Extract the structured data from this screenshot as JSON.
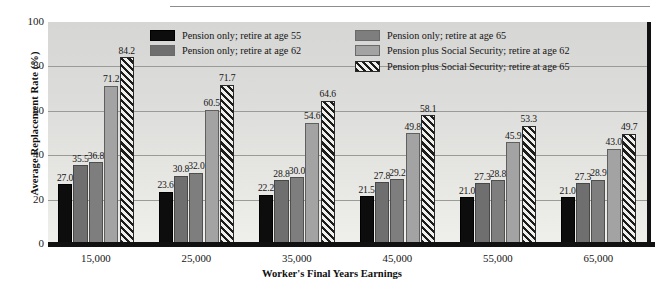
{
  "chart_data": {
    "type": "bar",
    "title": "",
    "subtitle": "",
    "xlabel": "Worker's Final Years Earnings",
    "ylabel": "Average Replacement Rate (%)",
    "categories": [
      "15,000",
      "25,000",
      "35,000",
      "45,000",
      "55,000",
      "65,000"
    ],
    "ylim": [
      0,
      100
    ],
    "yticks": [
      0,
      20,
      40,
      60,
      80,
      100
    ],
    "grid": true,
    "gridlines_at": [
      20,
      40,
      60,
      80
    ],
    "legend_position": "top-center",
    "series": [
      {
        "name": "Pension only; retire at age 55",
        "color": "#0d0d0d",
        "pattern": "solid",
        "values": [
          27.0,
          23.6,
          22.2,
          21.5,
          21.0,
          21.0
        ],
        "labels": [
          "27.0",
          "23.6",
          "22.2",
          "21.5",
          "21.0",
          "21.0"
        ]
      },
      {
        "name": "Pension only; retire at age 62",
        "color": "#6f6f6f",
        "pattern": "solid",
        "values": [
          35.5,
          30.8,
          28.8,
          27.8,
          27.3,
          27.3
        ],
        "labels": [
          "35.5",
          "30.8",
          "28.8",
          "27.8",
          "27.3",
          "27.3"
        ]
      },
      {
        "name": "Pension only; retire at age 65",
        "color": "#7e7e7e",
        "pattern": "solid",
        "values": [
          36.8,
          32.0,
          30.0,
          29.2,
          28.8,
          28.9
        ],
        "labels": [
          "36.8",
          "32.0",
          "30.0",
          "29.2",
          "28.8",
          "28.9"
        ]
      },
      {
        "name": "Pension plus Social Security; retire at age 62",
        "color": "#a3a3a3",
        "pattern": "solid",
        "values": [
          71.2,
          60.5,
          54.6,
          49.8,
          45.9,
          43.0
        ],
        "labels": [
          "71.2",
          "60.5",
          "54.6",
          "49.8",
          "45.9",
          "43.0"
        ]
      },
      {
        "name": "Pension plus Social Security; retire at age 65",
        "color": "#efefec",
        "pattern": "diagonal-hatch",
        "values": [
          84.2,
          71.7,
          64.6,
          58.1,
          53.3,
          49.7
        ],
        "labels": [
          "84.2",
          "71.7",
          "64.6",
          "58.1",
          "53.3",
          "49.7"
        ]
      }
    ]
  },
  "legend": {
    "column_a": [
      "Pension only; retire at age 55",
      "Pension only; retire at age 62"
    ],
    "column_b": [
      "Pension only; retire at age 65",
      "Pension plus Social Security; retire at age 62",
      "Pension plus Social Security; retire at age 65"
    ]
  },
  "axis": {
    "y_title": "Average Replacement Rate (%)",
    "x_title": "Worker's Final Years Earnings",
    "y_tick_labels": [
      "0",
      "20",
      "40",
      "60",
      "80",
      "100"
    ],
    "x_tick_labels": [
      "15,000",
      "25,000",
      "35,000",
      "45,000",
      "55,000",
      "65,000"
    ]
  }
}
